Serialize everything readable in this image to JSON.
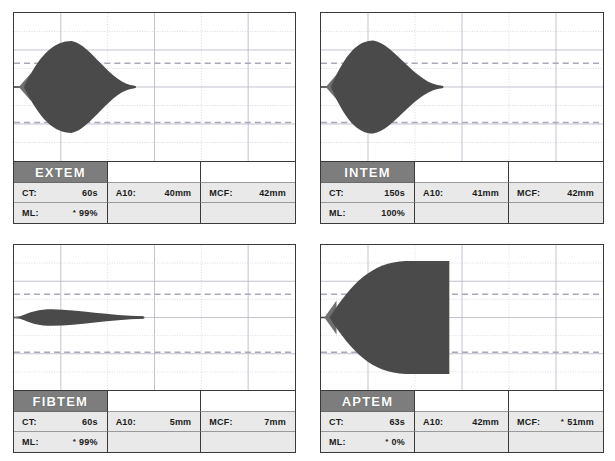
{
  "display": {
    "title": "ROTEM thromboelastometry four-channel result display",
    "colors": {
      "curve_fill": "#4a4a4a",
      "curve_edge_light": "#6f6f6f",
      "panel_border": "#3a3a3a",
      "assay_header_bg": "#7d7d7d",
      "assay_header_text": "#ffffff",
      "cell_bg": "#e9e9e9",
      "grid_solid": "#b4b4c4",
      "grid_dotted": "#c8c8d4",
      "reference_dash": "#a8a8b8"
    },
    "grid": {
      "vertical_lines": 5,
      "horizontal_solid_lines": 3,
      "horizontal_dotted_lines": 4,
      "reference_dashed_lines": 2,
      "reference_dash_y_fraction": [
        0.34,
        0.74
      ]
    },
    "labels": {
      "ct": "CT:",
      "a10": "A10:",
      "mcf": "MCF:",
      "ml": "ML:",
      "flag": "*"
    }
  },
  "panels": [
    {
      "id": "extem",
      "assay": "EXTEM",
      "measurements": {
        "ct": {
          "label": "CT:",
          "value": "60s",
          "flagged": false
        },
        "a10": {
          "label": "A10:",
          "value": "40mm",
          "flagged": false
        },
        "mcf": {
          "label": "MCF:",
          "value": "42mm",
          "flagged": false
        },
        "ml": {
          "label": "ML:",
          "value": "99%",
          "flagged": true
        }
      },
      "curve": {
        "ct_x": 0.035,
        "peak_x": 0.205,
        "amplitude": 0.62,
        "tail_x": 0.43,
        "tail_amplitude": 0.018,
        "shape": "lens",
        "lysis": "full"
      }
    },
    {
      "id": "intem",
      "assay": "INTEM",
      "measurements": {
        "ct": {
          "label": "CT:",
          "value": "150s",
          "flagged": false
        },
        "a10": {
          "label": "A10:",
          "value": "41mm",
          "flagged": false
        },
        "mcf": {
          "label": "MCF:",
          "value": "42mm",
          "flagged": false
        },
        "ml": {
          "label": "ML:",
          "value": "100%",
          "flagged": false
        }
      },
      "curve": {
        "ct_x": 0.035,
        "peak_x": 0.185,
        "amplitude": 0.63,
        "tail_x": 0.43,
        "tail_amplitude": 0.018,
        "shape": "lens",
        "lysis": "full"
      }
    },
    {
      "id": "fibtem",
      "assay": "FIBTEM",
      "measurements": {
        "ct": {
          "label": "CT:",
          "value": "60s",
          "flagged": false
        },
        "a10": {
          "label": "A10:",
          "value": "5mm",
          "flagged": false
        },
        "mcf": {
          "label": "MCF:",
          "value": "7mm",
          "flagged": false
        },
        "ml": {
          "label": "ML:",
          "value": "99%",
          "flagged": true
        }
      },
      "curve": {
        "ct_x": 0.015,
        "peak_x": 0.135,
        "amplitude": 0.115,
        "tail_x": 0.46,
        "tail_amplitude": 0.016,
        "shape": "lens",
        "lysis": "full"
      }
    },
    {
      "id": "aptem",
      "assay": "APTEM",
      "measurements": {
        "ct": {
          "label": "CT:",
          "value": "63s",
          "flagged": false
        },
        "a10": {
          "label": "A10:",
          "value": "42mm",
          "flagged": false
        },
        "mcf": {
          "label": "MCF:",
          "value": "51mm",
          "flagged": true
        },
        "ml": {
          "label": "ML:",
          "value": "0%",
          "flagged": true
        }
      },
      "curve": {
        "ct_x": 0.03,
        "peak_x": 0.3,
        "amplitude": 0.78,
        "tail_x": 0.455,
        "tail_amplitude": 0.78,
        "shape": "plateau",
        "lysis": "none"
      }
    }
  ]
}
